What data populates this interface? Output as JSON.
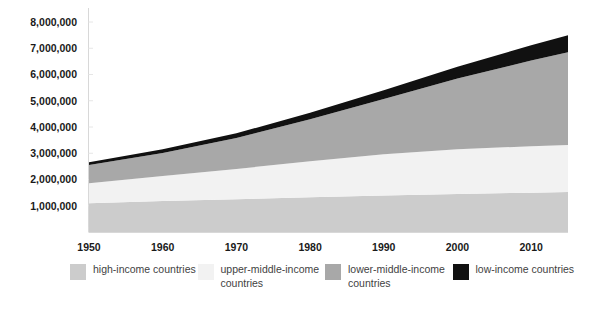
{
  "chart_data": {
    "type": "area",
    "stacked": true,
    "title": "",
    "subtitle": "",
    "xlabel": "",
    "ylabel": "",
    "xlim": [
      1950,
      2015
    ],
    "ylim": [
      0,
      8000000
    ],
    "grid": false,
    "legend_position": "bottom",
    "x": [
      1950,
      1960,
      1970,
      1980,
      1990,
      2000,
      2010,
      2015
    ],
    "x_tick_labels": [
      "1950",
      "1960",
      "1970",
      "1980",
      "1990",
      "2000",
      "2010"
    ],
    "x_ticks": [
      1950,
      1960,
      1970,
      1980,
      1990,
      2000,
      2010
    ],
    "y_ticks": [
      1000000,
      2000000,
      3000000,
      4000000,
      5000000,
      6000000,
      7000000,
      8000000
    ],
    "y_tick_labels": [
      "1,000,000",
      "2,000,000",
      "3,000,000",
      "4,000,000",
      "5,000,000",
      "6,000,000",
      "7,000,000",
      "8,000,000"
    ],
    "series": [
      {
        "name": "high-income countries",
        "color": "#cccccc",
        "values": [
          1100000,
          1180000,
          1250000,
          1320000,
          1390000,
          1450000,
          1500000,
          1520000
        ]
      },
      {
        "name": "upper-middle-income countries",
        "color": "#f2f2f2",
        "values": [
          760000,
          950000,
          1150000,
          1380000,
          1570000,
          1700000,
          1770000,
          1790000
        ]
      },
      {
        "name": "lower-middle-income countries",
        "color": "#a8a8a8",
        "values": [
          690000,
          880000,
          1180000,
          1600000,
          2110000,
          2700000,
          3260000,
          3540000
        ]
      },
      {
        "name": "low-income countries",
        "color": "#111111",
        "values": [
          110000,
          140000,
          180000,
          240000,
          330000,
          450000,
          580000,
          650000
        ]
      }
    ],
    "totals": [
      2660000,
      3150000,
      3760000,
      4540000,
      5400000,
      6300000,
      7110000,
      7500000
    ]
  },
  "legend": {
    "items": [
      {
        "label": "high-income countries",
        "color": "#cccccc"
      },
      {
        "label": "upper-middle-income countries",
        "color": "#f2f2f2"
      },
      {
        "label": "lower-middle-income countries",
        "color": "#a8a8a8"
      },
      {
        "label": "low-income countries",
        "color": "#111111"
      }
    ]
  },
  "axis": {
    "line_color": "#d8d8d8"
  }
}
